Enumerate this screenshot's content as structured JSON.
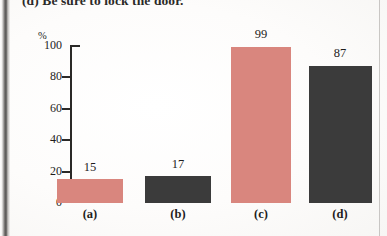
{
  "caption": {
    "text": "(d) Be sure to lock the door."
  },
  "chart_data": {
    "type": "bar",
    "title": "",
    "subtitle": "",
    "xlabel": "",
    "ylabel": "%",
    "categories": [
      "(a)",
      "(b)",
      "(c)",
      "(d)"
    ],
    "values": [
      15,
      17,
      99,
      87
    ],
    "value_labels": [
      "15",
      "17",
      "99",
      "87"
    ],
    "bar_colors": [
      "#d9867e",
      "#3b3b3b",
      "#d9867e",
      "#3b3b3b"
    ],
    "ylim": [
      0,
      100
    ],
    "yticks": [
      0,
      20,
      40,
      60,
      80,
      100
    ],
    "ytick_labels": [
      "0",
      "20",
      "40",
      "60",
      "80",
      "100"
    ],
    "grid": false,
    "legend": false,
    "legend_position": "none",
    "axis_color": "#2a2927"
  },
  "colors": {
    "pink": "#d9867e",
    "dark_gray": "#3b3b3b",
    "axis": "#2a2927",
    "text": "#1e1d1c",
    "page": "#fdfdfc"
  }
}
